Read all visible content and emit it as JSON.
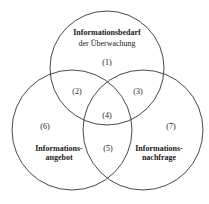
{
  "diagram": {
    "type": "venn",
    "circles": [
      {
        "id": "top",
        "title_line1": "Informationsbedarf",
        "title_line2": "der Überwachung",
        "cx": 107,
        "cy": 68,
        "r": 57
      },
      {
        "id": "left",
        "title_line1": "Informations-",
        "title_line2": "angebot",
        "cx": 72,
        "cy": 130,
        "r": 60
      },
      {
        "id": "right",
        "title_line1": "Informations-",
        "title_line2": "nachfrage",
        "cx": 143,
        "cy": 130,
        "r": 60
      }
    ],
    "regions": [
      {
        "label": "(1)",
        "x": 107,
        "y": 62
      },
      {
        "label": "(2)",
        "x": 77,
        "y": 91
      },
      {
        "label": "(3)",
        "x": 138,
        "y": 91
      },
      {
        "label": "(4)",
        "x": 107,
        "y": 115
      },
      {
        "label": "(5)",
        "x": 108,
        "y": 148
      },
      {
        "label": "(6)",
        "x": 45,
        "y": 126
      },
      {
        "label": "(7)",
        "x": 171,
        "y": 126
      }
    ],
    "stroke_color": "#333333"
  }
}
